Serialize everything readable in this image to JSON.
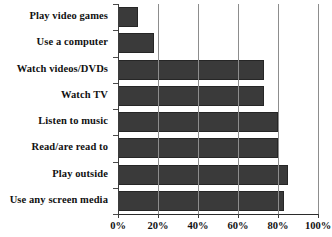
{
  "chart_data": {
    "type": "bar",
    "orientation": "horizontal",
    "title": "",
    "xlabel": "",
    "ylabel": "",
    "xlim": [
      0,
      100
    ],
    "xticks": [
      "0%",
      "20%",
      "40%",
      "60%",
      "80%",
      "100%"
    ],
    "xtick_values": [
      0,
      20,
      40,
      60,
      80,
      100
    ],
    "grid": true,
    "legend": false,
    "bar_color": "#3a3a3a",
    "bar_edge_color": "#262626",
    "axis_color": "#2b2b2b",
    "categories": [
      "Play video games",
      "Use a computer",
      "Watch videos/DVDs",
      "Watch TV",
      "Listen to music",
      "Read/are read to",
      "Play outside",
      "Use any screen media"
    ],
    "values": [
      10,
      18,
      73,
      73,
      80,
      80,
      85,
      83
    ]
  }
}
